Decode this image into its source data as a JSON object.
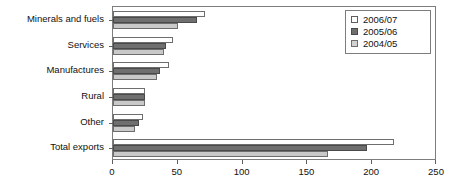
{
  "chart_data": {
    "type": "bar",
    "orientation": "horizontal",
    "title": "",
    "subtitle": "",
    "xlabel": "",
    "ylabel": "",
    "xlim": [
      0,
      250
    ],
    "xticks": [
      0,
      50,
      100,
      150,
      200,
      250
    ],
    "grid": false,
    "legend_position": "top-right",
    "categories": [
      "Minerals and fuels",
      "Services",
      "Manufactures",
      "Rural",
      "Other",
      "Total exports"
    ],
    "series": [
      {
        "name": "2006/07",
        "color": "#ffffff",
        "values": [
          71,
          46,
          43,
          25,
          23,
          217
        ]
      },
      {
        "name": "2005/06",
        "color": "#6f6f6f",
        "values": [
          65,
          41,
          36,
          25,
          20,
          196
        ]
      },
      {
        "name": "2004/05",
        "color": "#c9c9c9",
        "values": [
          50,
          39,
          34,
          25,
          17,
          166
        ]
      }
    ]
  }
}
